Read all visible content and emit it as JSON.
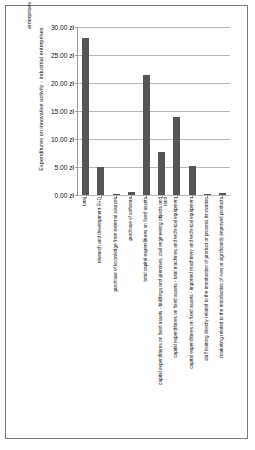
{
  "chart_data": {
    "type": "bar",
    "title": "",
    "xlabel": "",
    "ylabel": "Expenditures on innovative activity - industrial enterprises",
    "ylabel_overlap": "enterprises",
    "ylim": [
      0,
      30
    ],
    "ytick_labels": [
      "30.00 zł",
      "25.00 zł",
      "20.00 zł",
      "15.00 zł",
      "10.00 zł",
      "5.00 zł",
      "0.00 zł"
    ],
    "ytick_values": [
      30,
      25,
      20,
      15,
      10,
      5,
      0
    ],
    "grid": true,
    "legend": "none",
    "bar_color": "#555555",
    "currency": "zł",
    "categories": [
      "total",
      "research and development R+D",
      "purchase of knowledge from external sources",
      "purchase of software",
      "total capital expenditures on fixed assets",
      "capital expenditures on fixed assets - buildings and premises, civil engineering objects and land",
      "capital expenditures on fixed assets - total machines and technical equipment",
      "capital expenditures on fixed assets - imported machinery and technical equipment",
      "staff training directly related to the introduction of product or process innovation",
      "marketing related to the introduction of new or significantly improved products"
    ],
    "values": [
      28.0,
      5.0,
      0.2,
      0.45,
      21.5,
      7.7,
      14.0,
      5.1,
      0.15,
      0.3
    ]
  }
}
